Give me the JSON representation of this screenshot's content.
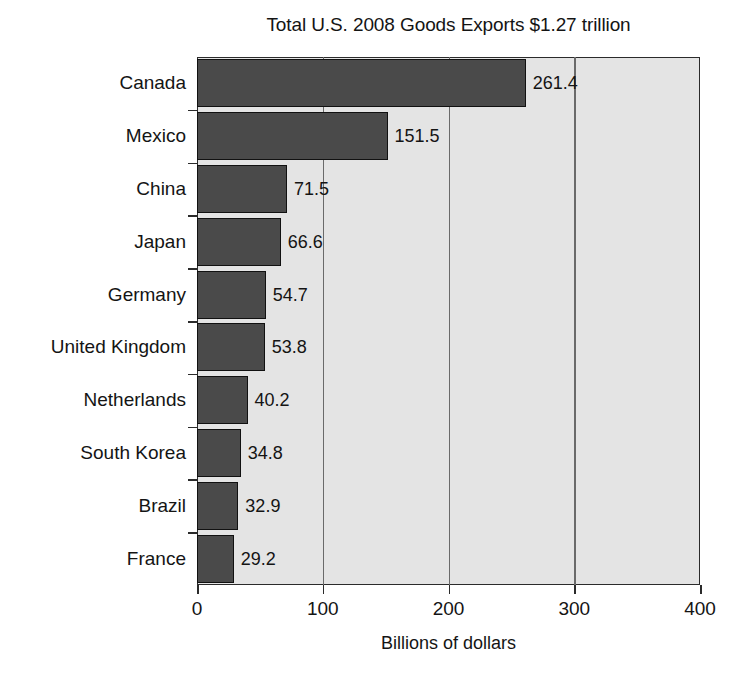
{
  "chart_data": {
    "type": "bar",
    "orientation": "horizontal",
    "title": "Total U.S. 2008 Goods Exports $1.27 trillion",
    "xlabel": "Billions of dollars",
    "ylabel": "",
    "xlim": [
      0,
      400
    ],
    "xticks": [
      0,
      100,
      200,
      300,
      400
    ],
    "xtick_labels": [
      "0",
      "100",
      "200",
      "300",
      "400"
    ],
    "grid": true,
    "grid_axis": "x",
    "legend": false,
    "categories": [
      "Canada",
      "Mexico",
      "China",
      "Japan",
      "Germany",
      "United Kingdom",
      "Netherlands",
      "South Korea",
      "Brazil",
      "France"
    ],
    "values": [
      261.4,
      151.5,
      71.5,
      66.6,
      54.7,
      53.8,
      40.2,
      34.8,
      32.9,
      29.2
    ],
    "value_labels": [
      "261.4",
      "151.5",
      "71.5",
      "66.6",
      "54.7",
      "53.8",
      "40.2",
      "34.8",
      "32.9",
      "29.2"
    ],
    "colors": {
      "bar_fill": "#4a4a4a",
      "bar_edge": "#111111",
      "plot_background": "#e4e4e4",
      "gridline": "#6a6a6a",
      "axis": "#2b2b2b",
      "text": "#141414",
      "page_background": "#ffffff"
    }
  }
}
